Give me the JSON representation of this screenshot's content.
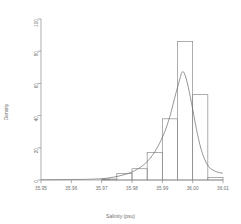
{
  "chart_data": {
    "type": "bar",
    "title": "",
    "subtitle": "",
    "xlabel": "Salinity (psu)",
    "ylabel": "Density",
    "grid": false,
    "legend": null,
    "xlim": [
      35.95,
      36.01
    ],
    "ylim": [
      0,
      100
    ],
    "xtick_labels": [
      "35.95",
      "35.96",
      "35.97",
      "35.98",
      "35.99",
      "36.00",
      "36.01"
    ],
    "xtick_values": [
      35.95,
      35.96,
      35.97,
      35.98,
      35.99,
      36.0,
      36.01
    ],
    "ytick_labels": [
      "0",
      "20",
      "40",
      "60",
      "80",
      "100"
    ],
    "ytick_values": [
      0,
      20,
      40,
      60,
      80,
      100
    ],
    "bin_width": 0.0005,
    "bars": [
      {
        "x0": 35.97,
        "x1": 35.9705,
        "value": 0.6
      },
      {
        "x0": 35.9705,
        "x1": 35.971,
        "value": 0.6
      },
      {
        "x0": 35.971,
        "x1": 35.9715,
        "value": 0.6
      },
      {
        "x0": 35.9715,
        "x1": 35.972,
        "value": 0.6
      },
      {
        "x0": 35.972,
        "x1": 35.9725,
        "value": 0.6
      },
      {
        "x0": 35.9725,
        "x1": 35.975,
        "value": 0.6
      },
      {
        "x0": 35.975,
        "x1": 35.98,
        "value": 4.0
      },
      {
        "x0": 35.98,
        "x1": 35.985,
        "value": 7.0
      },
      {
        "x0": 35.985,
        "x1": 35.99,
        "value": 17.0
      },
      {
        "x0": 35.99,
        "x1": 35.995,
        "value": 38.0
      },
      {
        "x0": 35.995,
        "x1": 36.0,
        "value": 86.0
      },
      {
        "x0": 36.0,
        "x1": 36.005,
        "value": 53.0
      },
      {
        "x0": 36.005,
        "x1": 36.01,
        "value": 1.5
      }
    ],
    "density_curve": {
      "label": "kernel density estimate",
      "peak_x": 35.9965,
      "peak_y": 67.0,
      "points": [
        [
          35.95,
          0.2
        ],
        [
          35.955,
          0.2
        ],
        [
          35.96,
          0.3
        ],
        [
          35.965,
          0.4
        ],
        [
          35.97,
          0.8
        ],
        [
          35.972,
          1.2
        ],
        [
          35.974,
          1.8
        ],
        [
          35.976,
          2.6
        ],
        [
          35.978,
          3.6
        ],
        [
          35.98,
          5.0
        ],
        [
          35.9815,
          6.4
        ],
        [
          35.983,
          8.2
        ],
        [
          35.9845,
          10.5
        ],
        [
          35.986,
          13.5
        ],
        [
          35.9875,
          17.5
        ],
        [
          35.989,
          22.5
        ],
        [
          35.99,
          26.5
        ],
        [
          35.991,
          31.0
        ],
        [
          35.992,
          36.5
        ],
        [
          35.993,
          43.0
        ],
        [
          35.994,
          50.5
        ],
        [
          35.995,
          57.5
        ],
        [
          35.9958,
          63.0
        ],
        [
          35.9965,
          67.0
        ],
        [
          35.9972,
          66.5
        ],
        [
          35.998,
          62.0
        ],
        [
          35.9988,
          55.5
        ],
        [
          35.9996,
          48.0
        ],
        [
          36.0004,
          40.0
        ],
        [
          36.0012,
          32.0
        ],
        [
          36.002,
          25.0
        ],
        [
          36.0028,
          19.0
        ],
        [
          36.0036,
          14.5
        ],
        [
          36.0044,
          11.0
        ],
        [
          36.0052,
          8.5
        ],
        [
          36.006,
          7.0
        ],
        [
          36.007,
          5.8
        ],
        [
          36.008,
          5.0
        ],
        [
          36.009,
          4.5
        ],
        [
          36.01,
          4.2
        ]
      ]
    },
    "colors": {
      "bar_border": "#8a8a8a",
      "bar_fill": "transparent",
      "curve": "#6a6a6a",
      "axis": "#8a8a8a",
      "text": "#6d6d6d"
    }
  }
}
